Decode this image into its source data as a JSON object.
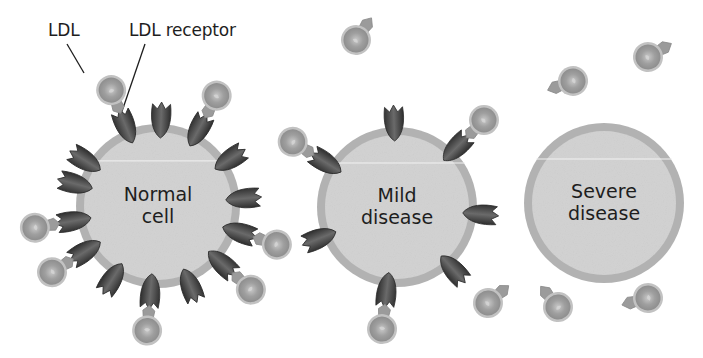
{
  "figure": {
    "type": "diagram",
    "colors": {
      "background": "#ffffff",
      "cell_fill": "#d3d3d3",
      "cell_rim": "#b2b2b2",
      "receptor_fill": "#4a4a4a",
      "receptor_highlight": "#777777",
      "ldl_fill": "#a3a3a3",
      "ldl_rim": "#c2c2c2",
      "ldl_stem": "#9b9b9b",
      "text": "#1e1e1e",
      "leader_line": "#1e1e1e"
    }
  },
  "labels": {
    "ldl": {
      "text": "LDL",
      "x": 48,
      "y": 22
    },
    "ldl_receptor": {
      "text": "LDL receptor",
      "x": 129,
      "y": 22
    }
  },
  "leader_lines": [
    {
      "name": "ldl-leader",
      "x1": 67,
      "y1": 44,
      "x2": 84,
      "y2": 73
    },
    {
      "name": "ldl-receptor-leader",
      "x1": 145,
      "y1": 44,
      "x2": 119,
      "y2": 120
    }
  ],
  "cells": [
    {
      "id": "normal",
      "label_line1": "Normal",
      "label_line2": "cell",
      "cx": 158,
      "cy": 206,
      "r": 82,
      "receptors": [
        {
          "angle": -112,
          "bound": true
        },
        {
          "angle": -88,
          "bound": false
        },
        {
          "angle": -62,
          "bound": true
        },
        {
          "angle": -33,
          "bound": false
        },
        {
          "angle": -148,
          "bound": false
        },
        {
          "angle": -5,
          "bound": false
        },
        {
          "angle": 18,
          "bound": true
        },
        {
          "angle": 170,
          "bound": true
        },
        {
          "angle": 195,
          "bound": false
        },
        {
          "angle": 148,
          "bound": true
        },
        {
          "angle": 122,
          "bound": false
        },
        {
          "angle": 95,
          "bound": true
        },
        {
          "angle": 68,
          "bound": false
        },
        {
          "angle": 42,
          "bound": true
        }
      ]
    },
    {
      "id": "mild",
      "label_line1": "Mild",
      "label_line2": "disease",
      "cx": 397,
      "cy": 207,
      "r": 80,
      "receptors": [
        {
          "angle": -92,
          "bound": false
        },
        {
          "angle": -45,
          "bound": true
        },
        {
          "angle": -148,
          "bound": true
        },
        {
          "angle": 5,
          "bound": false
        },
        {
          "angle": 48,
          "bound": false
        },
        {
          "angle": 97,
          "bound": true
        },
        {
          "angle": 158,
          "bound": false
        }
      ]
    },
    {
      "id": "severe",
      "label_line1": "Severe",
      "label_line2": "disease",
      "cx": 604,
      "cy": 203,
      "r": 80,
      "receptors": []
    }
  ],
  "free_ldl": [
    {
      "x": 356,
      "y": 40,
      "stem_angle": -55
    },
    {
      "x": 573,
      "y": 81,
      "stem_angle": 160
    },
    {
      "x": 648,
      "y": 57,
      "stem_angle": -30
    },
    {
      "x": 488,
      "y": 303,
      "stem_angle": -40
    },
    {
      "x": 558,
      "y": 307,
      "stem_angle": -130
    },
    {
      "x": 648,
      "y": 298,
      "stem_angle": 165
    }
  ],
  "cell_texts": {
    "normal": "Normal cell",
    "mild": "Mild disease",
    "severe": "Severe disease"
  }
}
